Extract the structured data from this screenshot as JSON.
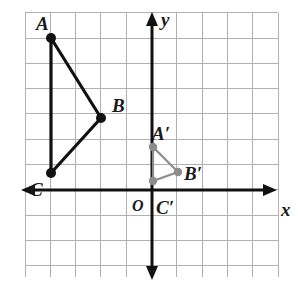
{
  "figure": {
    "background_color": "#ffffff",
    "grid": {
      "line_color": "#b0b0b0",
      "cell_size_px": 25.3,
      "left_px": 25,
      "top_px": 12.7,
      "right_px": 278,
      "bottom_px": 277,
      "columns": 10,
      "rows": 10
    },
    "axes": {
      "color": "#111111",
      "x_axis_label": "x",
      "y_axis_label": "y",
      "origin_label": "O",
      "x_axis_y_px": 190,
      "y_axis_x_px": 152,
      "arrows": "both-ends-each-axis"
    }
  },
  "chart_data": {
    "type": "scatter",
    "xlabel": "x",
    "ylabel": "y",
    "grid": true,
    "legend": "none",
    "xlim": [
      -5,
      5
    ],
    "ylim": [
      -3.5,
      7
    ],
    "series": [
      {
        "name": "Triangle ABC",
        "color": "#111111",
        "closed": false,
        "points": [
          {
            "label": "A",
            "x": -4,
            "y": 6,
            "px": 51,
            "py": 38,
            "label_px": 36,
            "label_py": 14
          },
          {
            "label": "B",
            "x": -2,
            "y": 3,
            "px": 101,
            "py": 118,
            "label_px": 112,
            "label_py": 96
          },
          {
            "label": "C",
            "x": -4,
            "y": 1,
            "px": 51,
            "py": 173,
            "label_px": 30,
            "label_py": 180
          }
        ]
      },
      {
        "name": "Triangle A'B'C'",
        "color": "#8c8c8c",
        "closed": false,
        "points": [
          {
            "label": "A′",
            "x": 0,
            "y": 2,
            "px": 153,
            "py": 147,
            "label_px": 152,
            "label_py": 124
          },
          {
            "label": "B′",
            "x": 1,
            "y": 1,
            "px": 178,
            "py": 172,
            "label_px": 184,
            "label_py": 164
          },
          {
            "label": "C′",
            "x": 0,
            "y": 0.4,
            "px": 153,
            "py": 181,
            "label_px": 156,
            "label_py": 198
          }
        ]
      }
    ],
    "annotations": [
      {
        "text": "O",
        "x": 0,
        "y": 0,
        "px": 132,
        "py": 198
      },
      {
        "text": "x",
        "px": 281,
        "py": 200
      },
      {
        "text": "y",
        "px": 161,
        "py": 10
      }
    ]
  }
}
